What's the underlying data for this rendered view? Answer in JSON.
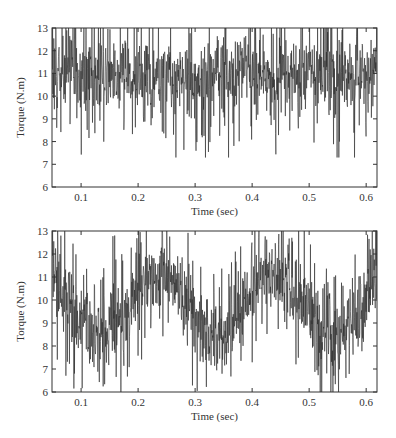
{
  "chart_data": [
    {
      "type": "line",
      "panel": "top",
      "title": "",
      "xlabel": "Time (sec)",
      "ylabel": "Torque (N.m)",
      "xlim": [
        0.049,
        0.619
      ],
      "ylim": [
        6,
        13
      ],
      "xticks": [
        0.1,
        0.2,
        0.3,
        0.4,
        0.5,
        0.6
      ],
      "xtick_labels": [
        "0.1",
        "0.2",
        "0.3",
        "0.4",
        "0.5",
        "0.6"
      ],
      "yticks": [
        6,
        7,
        8,
        9,
        10,
        11,
        12,
        13
      ],
      "ytick_labels": [
        "6",
        "7",
        "8",
        "9",
        "10",
        "11",
        "12",
        "13"
      ],
      "grid": false,
      "legend": null,
      "series": [
        {
          "name": "torque",
          "color": "#2a2a2a",
          "description": "Noisy torque signal around a constant mean",
          "mean": 10.9,
          "oscillation_amplitude": 0.0,
          "oscillation_period_s": 0.2,
          "noise_band": [
            7.5,
            13.0
          ],
          "typical_band": [
            9.5,
            12.3
          ],
          "samples": 1100,
          "seed": 7
        }
      ]
    },
    {
      "type": "line",
      "panel": "bottom",
      "title": "",
      "xlabel": "Time (sec)",
      "ylabel": "Torque (N.m)",
      "xlim": [
        0.049,
        0.619
      ],
      "ylim": [
        6,
        13
      ],
      "xticks": [
        0.1,
        0.2,
        0.3,
        0.4,
        0.5,
        0.6
      ],
      "xtick_labels": [
        "0.1",
        "0.2",
        "0.3",
        "0.4",
        "0.5",
        "0.6"
      ],
      "yticks": [
        6,
        7,
        8,
        9,
        10,
        11,
        12,
        13
      ],
      "ytick_labels": [
        "6",
        "7",
        "8",
        "9",
        "10",
        "11",
        "12",
        "13"
      ],
      "grid": false,
      "legend": null,
      "series": [
        {
          "name": "torque",
          "color": "#2a2a2a",
          "description": "Noisy torque signal with ~5 Hz sinusoidal ripple",
          "mean": 9.8,
          "oscillation_amplitude": 1.35,
          "oscillation_period_s": 0.205,
          "oscillation_peak_times_s": [
            0.03,
            0.235,
            0.44
          ],
          "oscillation_trough_times_s": [
            0.13,
            0.335,
            0.54
          ],
          "noise_band": [
            6.0,
            13.0
          ],
          "samples": 1100,
          "seed": 19
        }
      ]
    }
  ]
}
